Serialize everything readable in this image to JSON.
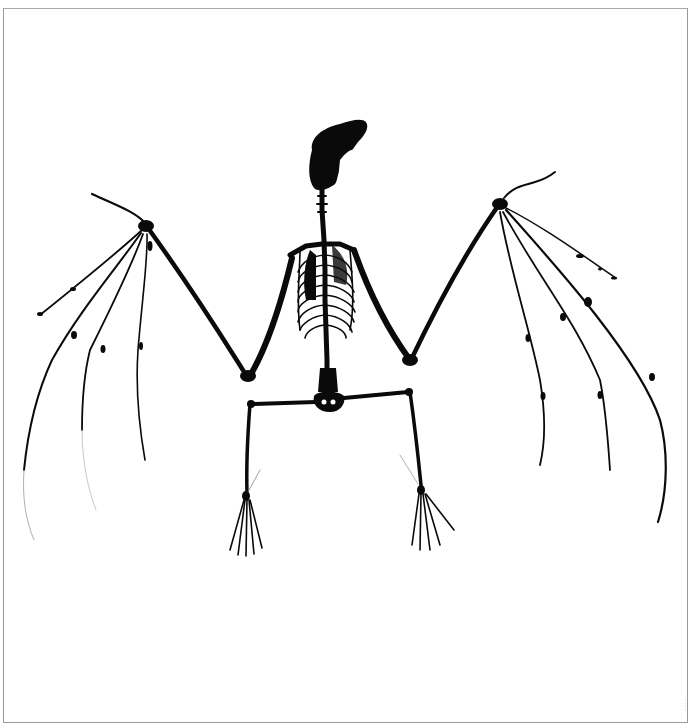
{
  "image": {
    "subject": "bat skeleton silhouette with outstretched wings",
    "background_color": "#ffffff",
    "silhouette_color": "#0a0a0a",
    "frame_color": "#9a9a9a",
    "caption": "· · · ·"
  }
}
